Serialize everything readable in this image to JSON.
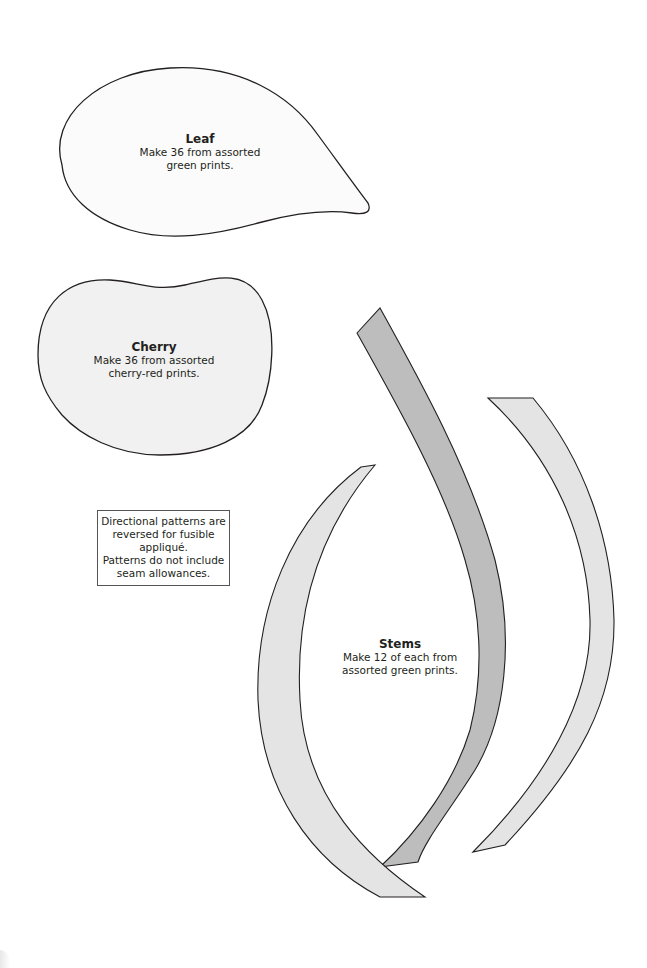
{
  "page": {
    "colors": {
      "outline": "#231f20",
      "leaf_fill": "#fbfbfb",
      "cherry_fill": "#f1f1f1",
      "stem_dark_fill": "#bdbdbd",
      "stem_light_fill": "#e4e4e4",
      "background": "#ffffff"
    }
  },
  "leaf": {
    "title": "Leaf",
    "description": "Make 36 from assorted\ngreen prints."
  },
  "cherry": {
    "title": "Cherry",
    "description": "Make 36 from assorted\ncherry-red prints."
  },
  "note": {
    "text": "Directional patterns are\nreversed for fusible appliqué.\nPatterns do not include\nseam allowances."
  },
  "stems": {
    "title": "Stems",
    "description": "Make 12 of each from\nassorted green prints."
  }
}
